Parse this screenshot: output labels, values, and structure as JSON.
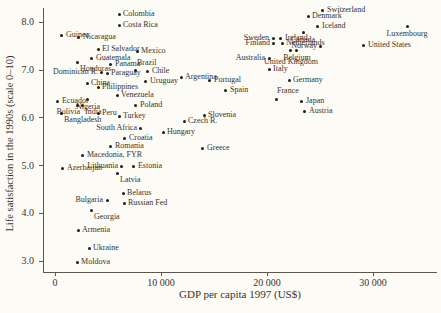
{
  "figure": {
    "background_color": "#fcfbf6",
    "ink_color": "#39342b",
    "dot_color": "#201d18"
  },
  "chart_data": {
    "type": "scatter",
    "title": "",
    "xlabel": "GDP per capita 1997 (US$)",
    "ylabel": "Life satisfaction in the 1990s (scale 0–10)",
    "xlim": [
      -1100,
      36000
    ],
    "ylim": [
      2.8,
      8.3
    ],
    "grid": false,
    "legend": "none",
    "x_ticks": [
      {
        "value": 0,
        "label": "0"
      },
      {
        "value": 10000,
        "label": "10 000"
      },
      {
        "value": 20000,
        "label": "20 000"
      },
      {
        "value": 30000,
        "label": "30 000"
      }
    ],
    "y_ticks": [
      {
        "value": 8.0,
        "label": "8.0"
      },
      {
        "value": 7.0,
        "label": "7.0"
      },
      {
        "value": 6.0,
        "label": "6.0"
      },
      {
        "value": 5.0,
        "label": "5.0"
      },
      {
        "value": 4.0,
        "label": "4.0"
      },
      {
        "value": 3.0,
        "label": "3.0"
      }
    ],
    "points": [
      {
        "name": "Colombia",
        "gdp": 6040,
        "satisfaction": 8.16,
        "label_pos": "r"
      },
      {
        "name": "Costa Rica",
        "gdp": 6040,
        "satisfaction": 7.93,
        "label_pos": "r"
      },
      {
        "name": "Switzerland",
        "gdp": 25280,
        "satisfaction": 8.24,
        "label_pos": "r"
      },
      {
        "name": "Denmark",
        "gdp": 23870,
        "satisfaction": 8.1,
        "label_pos": "r"
      },
      {
        "name": "Iceland",
        "gdp": 24810,
        "satisfaction": 7.89,
        "label_pos": "r"
      },
      {
        "name": "Luxembourg",
        "gdp": 33210,
        "satisfaction": 7.89,
        "label_pos": "b"
      },
      {
        "name": "Canada",
        "gdp": 23400,
        "satisfaction": 7.77,
        "label_pos": "b"
      },
      {
        "name": "Guinea",
        "gdp": 660,
        "satisfaction": 7.72,
        "label_pos": "r"
      },
      {
        "name": "Nicaragua",
        "gdp": 2260,
        "satisfaction": 7.66,
        "label_pos": "r"
      },
      {
        "name": "Sweden",
        "gdp": 20570,
        "satisfaction": 7.64,
        "label_pos": "l"
      },
      {
        "name": "Ireland",
        "gdp": 21320,
        "satisfaction": 7.64,
        "label_pos": "r"
      },
      {
        "name": "Finland",
        "gdp": 20660,
        "satisfaction": 7.55,
        "label_pos": "l"
      },
      {
        "name": "Netherlands",
        "gdp": 21420,
        "satisfaction": 7.55,
        "label_pos": "r"
      },
      {
        "name": "United States",
        "gdp": 29150,
        "satisfaction": 7.51,
        "label_pos": "r"
      },
      {
        "name": "Norway",
        "gdp": 25090,
        "satisfaction": 7.49,
        "label_pos": "l"
      },
      {
        "name": "El Salvador",
        "gdp": 4060,
        "satisfaction": 7.41,
        "label_pos": "r"
      },
      {
        "name": "Belgium",
        "gdp": 22830,
        "satisfaction": 7.39,
        "label_pos": "b"
      },
      {
        "name": "United Kingdom",
        "gdp": 22260,
        "satisfaction": 7.39,
        "label_pos": "b2"
      },
      {
        "name": "Mexico",
        "gdp": 7740,
        "satisfaction": 7.37,
        "label_pos": "r"
      },
      {
        "name": "Guatemala",
        "gdp": 3490,
        "satisfaction": 7.24,
        "label_pos": "r"
      },
      {
        "name": "Australia",
        "gdp": 20190,
        "satisfaction": 7.22,
        "label_pos": "l"
      },
      {
        "name": "Honduras",
        "gdp": 2080,
        "satisfaction": 7.14,
        "label_pos": "br"
      },
      {
        "name": "Panama",
        "gdp": 5280,
        "satisfaction": 7.11,
        "label_pos": "r"
      },
      {
        "name": "Italy",
        "gdp": 20190,
        "satisfaction": 7.01,
        "label_pos": "r"
      },
      {
        "name": "Brazil",
        "gdp": 7640,
        "satisfaction": 6.97,
        "label_pos": "a"
      },
      {
        "name": "Chile",
        "gdp": 8770,
        "satisfaction": 6.95,
        "label_pos": "r"
      },
      {
        "name": "Dominican R.",
        "gdp": 4430,
        "satisfaction": 6.93,
        "label_pos": "l"
      },
      {
        "name": "Paraguay",
        "gdp": 4910,
        "satisfaction": 6.91,
        "label_pos": "r"
      },
      {
        "name": "Argentina",
        "gdp": 11890,
        "satisfaction": 6.84,
        "label_pos": "r"
      },
      {
        "name": "Germany",
        "gdp": 22080,
        "satisfaction": 6.76,
        "label_pos": "r"
      },
      {
        "name": "Portugal",
        "gdp": 14620,
        "satisfaction": 6.76,
        "label_pos": "r"
      },
      {
        "name": "Uruguay",
        "gdp": 8580,
        "satisfaction": 6.74,
        "label_pos": "r"
      },
      {
        "name": "China",
        "gdp": 3020,
        "satisfaction": 6.7,
        "label_pos": "r"
      },
      {
        "name": "Philippines",
        "gdp": 4060,
        "satisfaction": 6.63,
        "label_pos": "r"
      },
      {
        "name": "Spain",
        "gdp": 16130,
        "satisfaction": 6.57,
        "label_pos": "r"
      },
      {
        "name": "Venezuela",
        "gdp": 5850,
        "satisfaction": 6.45,
        "label_pos": "r"
      },
      {
        "name": "Nigeria",
        "gdp": 3110,
        "satisfaction": 6.38,
        "label_pos": "b"
      },
      {
        "name": "France",
        "gdp": 20850,
        "satisfaction": 6.38,
        "label_pos": "a"
      },
      {
        "name": "Ecuador",
        "gdp": 280,
        "satisfaction": 6.34,
        "label_pos": "r"
      },
      {
        "name": "Japan",
        "gdp": 23300,
        "satisfaction": 6.34,
        "label_pos": "r"
      },
      {
        "name": "Bolivia",
        "gdp": 2080,
        "satisfaction": 6.24,
        "label_pos": "bl"
      },
      {
        "name": "India",
        "gdp": 2550,
        "satisfaction": 6.24,
        "label_pos": "br"
      },
      {
        "name": "Poland",
        "gdp": 7640,
        "satisfaction": 6.24,
        "label_pos": "r"
      },
      {
        "name": "Austria",
        "gdp": 23580,
        "satisfaction": 6.13,
        "label_pos": "r"
      },
      {
        "name": "Bangladesh",
        "gdp": 570,
        "satisfaction": 6.07,
        "label_pos": "br"
      },
      {
        "name": "Peru",
        "gdp": 4060,
        "satisfaction": 6.07,
        "label_pos": "r"
      },
      {
        "name": "Slovenia",
        "gdp": 14060,
        "satisfaction": 6.03,
        "label_pos": "r"
      },
      {
        "name": "Turkey",
        "gdp": 6040,
        "satisfaction": 6.01,
        "label_pos": "r"
      },
      {
        "name": "Czech R.",
        "gdp": 12170,
        "satisfaction": 5.92,
        "label_pos": "r"
      },
      {
        "name": "South Africa",
        "gdp": 8110,
        "satisfaction": 5.76,
        "label_pos": "l"
      },
      {
        "name": "Hungary",
        "gdp": 10190,
        "satisfaction": 5.69,
        "label_pos": "r"
      },
      {
        "name": "Croatia",
        "gdp": 6600,
        "satisfaction": 5.55,
        "label_pos": "r"
      },
      {
        "name": "Romania",
        "gdp": 5280,
        "satisfaction": 5.38,
        "label_pos": "r"
      },
      {
        "name": "Greece",
        "gdp": 13960,
        "satisfaction": 5.34,
        "label_pos": "r"
      },
      {
        "name": "Macedonia, FYR",
        "gdp": 2640,
        "satisfaction": 5.21,
        "label_pos": "r"
      },
      {
        "name": "Lithuania",
        "gdp": 6320,
        "satisfaction": 4.98,
        "label_pos": "l"
      },
      {
        "name": "Estonia",
        "gdp": 7450,
        "satisfaction": 4.98,
        "label_pos": "r"
      },
      {
        "name": "Azerbaijan",
        "gdp": 750,
        "satisfaction": 4.92,
        "label_pos": "r"
      },
      {
        "name": "Latvia",
        "gdp": 5850,
        "satisfaction": 4.83,
        "label_pos": "br"
      },
      {
        "name": "Belarus",
        "gdp": 6420,
        "satisfaction": 4.4,
        "label_pos": "r"
      },
      {
        "name": "Bulgaria",
        "gdp": 4910,
        "satisfaction": 4.25,
        "label_pos": "l"
      },
      {
        "name": "Russian Fed",
        "gdp": 6510,
        "satisfaction": 4.19,
        "label_pos": "r"
      },
      {
        "name": "Georgia",
        "gdp": 3400,
        "satisfaction": 4.06,
        "label_pos": "br"
      },
      {
        "name": "Armenia",
        "gdp": 2170,
        "satisfaction": 3.64,
        "label_pos": "r"
      },
      {
        "name": "Ukraine",
        "gdp": 3210,
        "satisfaction": 3.25,
        "label_pos": "r"
      },
      {
        "name": "Moldova",
        "gdp": 2080,
        "satisfaction": 2.97,
        "label_pos": "r"
      }
    ]
  }
}
